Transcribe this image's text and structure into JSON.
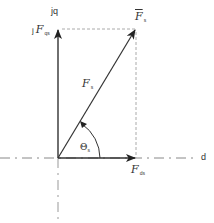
{
  "diagram": {
    "type": "phasor-diagram",
    "axes": {
      "d_axis_label": "d",
      "q_axis_label": "jq"
    },
    "vectors": {
      "resultant": {
        "symbol": "F",
        "subscript": "s",
        "label_plain": "Fs"
      },
      "resultant_along": {
        "symbol": "F",
        "subscript": "s",
        "label_plain": "Fs"
      },
      "q_component": {
        "prefix": "j",
        "symbol": "F",
        "subscript": "qs",
        "label_plain": "j Fqs"
      },
      "d_component": {
        "symbol": "F",
        "subscript": "ds",
        "label_plain": "Fds"
      }
    },
    "angle": {
      "symbol": "Θ",
      "subscript": "s",
      "label_plain": "Θs"
    },
    "colors": {
      "line": "#333333",
      "dashed": "#999999",
      "background": "#ffffff"
    }
  }
}
